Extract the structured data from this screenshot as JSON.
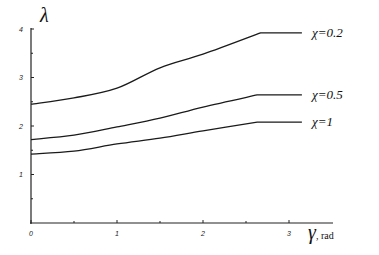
{
  "chart_data": {
    "type": "line",
    "title": "",
    "xlabel": "γ, rad",
    "ylabel": "λ",
    "xlim": [
      0,
      3.5
    ],
    "ylim": [
      0,
      4.1
    ],
    "x_ticks": [
      "0",
      "1",
      "2",
      "3"
    ],
    "y_ticks": [
      "1",
      "2",
      "3",
      "4"
    ],
    "grid": false,
    "legend_position": "inline-right",
    "series": [
      {
        "name": "χ=0.2",
        "x": [
          0,
          0.5,
          1,
          1.5,
          2,
          2.67,
          3.15
        ],
        "y": [
          2.45,
          2.58,
          2.78,
          3.2,
          3.48,
          3.92,
          3.92
        ]
      },
      {
        "name": "χ=0.5",
        "x": [
          0,
          0.5,
          1,
          1.5,
          2,
          2.63,
          3.15
        ],
        "y": [
          1.72,
          1.81,
          1.98,
          2.16,
          2.39,
          2.64,
          2.64
        ]
      },
      {
        "name": "χ=1",
        "x": [
          0,
          0.5,
          1,
          1.5,
          2,
          2.63,
          3.15
        ],
        "y": [
          1.42,
          1.48,
          1.63,
          1.75,
          1.9,
          2.08,
          2.08
        ]
      }
    ]
  },
  "labels": {
    "ylabel_symbol": "λ",
    "xlabel_symbol": "γ",
    "xlabel_unit": ", rad",
    "series_labels": [
      "χ=0.2",
      "χ=0.5",
      "χ=1"
    ],
    "x_tick_labels": [
      "0",
      "1",
      "2",
      "3"
    ],
    "y_tick_labels": [
      "1",
      "2",
      "3",
      "4"
    ]
  }
}
